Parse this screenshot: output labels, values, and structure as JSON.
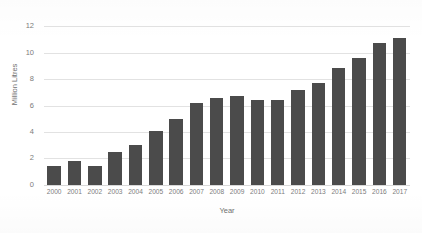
{
  "chart_data": {
    "type": "bar",
    "title": "",
    "xlabel": "Year",
    "ylabel": "Million Litres",
    "categories": [
      "2000",
      "2001",
      "2002",
      "2003",
      "2004",
      "2005",
      "2006",
      "2007",
      "2008",
      "2009",
      "2010",
      "2011",
      "2012",
      "2013",
      "2014",
      "2015",
      "2016",
      "2017"
    ],
    "values": [
      1.4,
      1.8,
      1.4,
      2.5,
      3.0,
      4.1,
      5.0,
      6.2,
      6.6,
      6.7,
      6.4,
      6.4,
      7.2,
      7.7,
      8.8,
      9.6,
      10.7,
      11.1
    ],
    "ylim": [
      0,
      12
    ],
    "yticks": [
      0,
      2,
      4,
      6,
      8,
      10,
      12
    ],
    "ytick_labels": [
      "0",
      "2",
      "4",
      "6",
      "8",
      "10",
      "12"
    ],
    "grid": true,
    "legend": "none",
    "series_color": "#4b4b4b",
    "background_color": "#ffffff",
    "gridline_color": "#e2e2e2"
  }
}
